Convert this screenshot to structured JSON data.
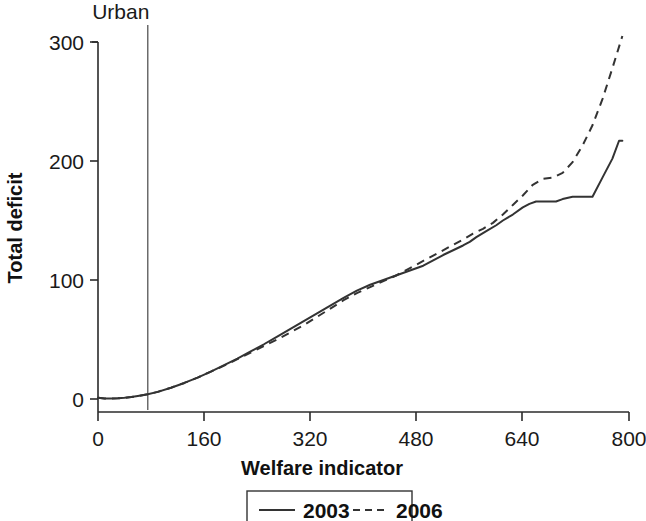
{
  "chart_data": {
    "type": "line",
    "title": "",
    "xlabel": "Welfare indicator",
    "ylabel": "Total deficit",
    "xlim": [
      0,
      800
    ],
    "ylim": [
      0,
      310
    ],
    "xticks": [
      0,
      160,
      320,
      480,
      640,
      800
    ],
    "xtick_labels": [
      "0",
      "160",
      "320",
      "480",
      "640",
      "800"
    ],
    "yticks": [
      0,
      100,
      200,
      300
    ],
    "ytick_labels": [
      "0",
      "100",
      "200",
      "300"
    ],
    "grid": false,
    "legend_position": "bottom-center",
    "annotations": [
      {
        "label": "Urban",
        "type": "vline",
        "x": 75
      }
    ],
    "series": [
      {
        "name": "2003",
        "style": "solid",
        "x": [
          0,
          10,
          20,
          30,
          40,
          50,
          60,
          75,
          90,
          110,
          130,
          150,
          170,
          190,
          210,
          230,
          250,
          270,
          290,
          310,
          330,
          350,
          370,
          390,
          410,
          430,
          450,
          470,
          490,
          500,
          510,
          520,
          535,
          550,
          560,
          570,
          585,
          600,
          610,
          625,
          640,
          650,
          660,
          675,
          690,
          700,
          715,
          730,
          745,
          760,
          775,
          785,
          790
        ],
        "y": [
          1,
          0.5,
          0.4,
          0.6,
          1,
          1.6,
          2.5,
          4,
          6,
          9.5,
          13.5,
          18,
          23,
          28.5,
          34,
          40,
          46,
          52.5,
          59,
          65.5,
          72,
          78.5,
          85,
          91,
          96,
          100,
          104,
          108,
          112,
          115,
          118,
          121,
          125,
          129,
          132,
          136,
          141,
          146,
          150,
          155,
          161,
          164,
          166,
          166,
          166,
          168,
          170,
          170,
          170,
          186,
          202,
          217,
          217
        ]
      },
      {
        "name": "2006",
        "style": "dashed",
        "x": [
          0,
          10,
          20,
          30,
          40,
          50,
          60,
          75,
          90,
          110,
          130,
          150,
          170,
          190,
          210,
          230,
          250,
          270,
          290,
          310,
          330,
          350,
          370,
          390,
          410,
          430,
          450,
          470,
          490,
          510,
          530,
          550,
          565,
          580,
          595,
          610,
          625,
          640,
          655,
          670,
          685,
          700,
          715,
          730,
          745,
          760,
          775,
          790
        ],
        "y": [
          1,
          0.5,
          0.4,
          0.6,
          1,
          1.6,
          2.5,
          4,
          6,
          9.5,
          13.5,
          18,
          23,
          28,
          33.5,
          39,
          44.5,
          50,
          56,
          62,
          69,
          76,
          83,
          89,
          94,
          99,
          104,
          110,
          116,
          122,
          128,
          134,
          139,
          143,
          148,
          155,
          163,
          171,
          180,
          185,
          186,
          190,
          199,
          213,
          230,
          252,
          278,
          305
        ]
      }
    ],
    "legend": [
      {
        "label": "2003",
        "style": "solid"
      },
      {
        "label": "2006",
        "style": "dashed"
      }
    ]
  }
}
